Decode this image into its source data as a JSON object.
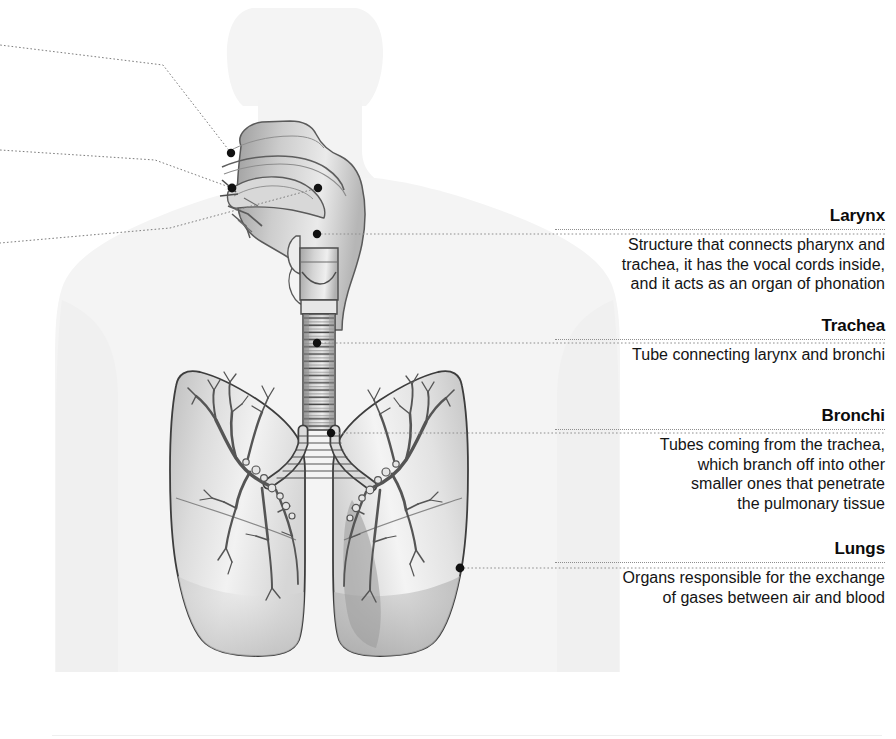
{
  "figure": {
    "background_color": "#ffffff",
    "silhouette_color": "#f4f4f4",
    "leader_color": "#8e8e8e",
    "marker_color": "#111111",
    "organ_outline_color": "#4a4a4a"
  },
  "labels": [
    {
      "id": "larynx",
      "heading": "Larynx",
      "body": "Structure that connects pharynx and\ntrachea, it has the vocal cords inside,\nand it acts as an organ of phonation",
      "top": 206,
      "marker": {
        "x": 317,
        "y": 234
      },
      "leader_y": 234
    },
    {
      "id": "trachea",
      "heading": "Trachea",
      "body": "Tube connecting larynx and bronchi",
      "top": 316,
      "marker": {
        "x": 317,
        "y": 343
      },
      "leader_y": 343
    },
    {
      "id": "bronchi",
      "heading": "Bronchi",
      "body": "Tubes coming from the trachea,\nwhich branch off into other\nsmaller ones that penetrate\nthe pulmonary tissue",
      "top": 406,
      "marker": {
        "x": 331,
        "y": 433
      },
      "leader_y": 433
    },
    {
      "id": "lungs",
      "heading": "Lungs",
      "body": "Organs responsible for the exchange\nof gases between air and blood",
      "top": 539,
      "marker": {
        "x": 460,
        "y": 568
      },
      "leader_y": 568
    }
  ],
  "left_leaders": [
    {
      "id": "nasal-cavity-leader",
      "marker": {
        "x": 231,
        "y": 153
      },
      "edge_y": 45
    },
    {
      "id": "pharynx-leader",
      "marker": {
        "x": 232,
        "y": 188
      },
      "edge_y": 150
    },
    {
      "id": "mouth-leader",
      "marker": {
        "x": 232,
        "y": 190
      },
      "edge_y": 243
    }
  ],
  "unlabeled_markers": [
    {
      "id": "epiglottis-marker",
      "x": 318,
      "y": 188
    }
  ]
}
